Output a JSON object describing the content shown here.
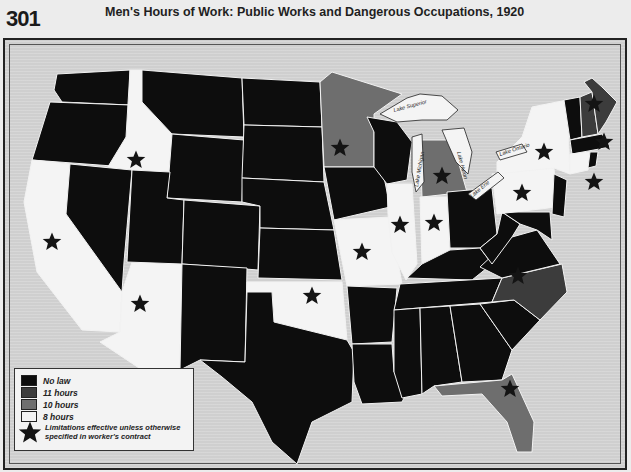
{
  "header": {
    "plate_number": "301",
    "title": "Men's Hours of Work: Public Works and Dangerous Occupations, 1920"
  },
  "colors": {
    "no_law": "#0d0d0d",
    "11_hours": "#3c3c3c",
    "10_hours": "#6e6e6e",
    "8_hours": "#f4f4f4",
    "background": "#cfcfcf",
    "star": "#141414"
  },
  "legend": {
    "items": [
      {
        "key": "no_law",
        "label": "No law",
        "color": "#0d0d0d"
      },
      {
        "key": "11_hours",
        "label": "11 hours",
        "color": "#3c3c3c"
      },
      {
        "key": "10_hours",
        "label": "10 hours",
        "color": "#6e6e6e"
      },
      {
        "key": "8_hours",
        "label": "8 hours",
        "color": "#f4f4f4"
      }
    ],
    "star_note": "Limitations effective unless otherwise specified in worker's contract"
  },
  "lakes": [
    {
      "name": "Lake Superior",
      "label": "Lake Superior"
    },
    {
      "name": "Lake Michigan",
      "label": "Lake Michigan"
    },
    {
      "name": "Lake Huron",
      "label": "Lake Huron"
    },
    {
      "name": "Lake Erie",
      "label": "Lake Erie"
    },
    {
      "name": "Lake Ontario",
      "label": "Lake Ontario"
    }
  ],
  "states": [
    {
      "name": "Washington",
      "category": "no_law",
      "star": false
    },
    {
      "name": "Oregon",
      "category": "no_law",
      "star": false
    },
    {
      "name": "California",
      "category": "8_hours",
      "star": true
    },
    {
      "name": "Idaho",
      "category": "8_hours",
      "star": true
    },
    {
      "name": "Nevada",
      "category": "no_law",
      "star": false
    },
    {
      "name": "Arizona",
      "category": "8_hours",
      "star": true
    },
    {
      "name": "Montana",
      "category": "no_law",
      "star": false
    },
    {
      "name": "Wyoming",
      "category": "no_law",
      "star": false
    },
    {
      "name": "Utah",
      "category": "no_law",
      "star": false
    },
    {
      "name": "Colorado",
      "category": "no_law",
      "star": false
    },
    {
      "name": "New Mexico",
      "category": "no_law",
      "star": false
    },
    {
      "name": "North Dakota",
      "category": "no_law",
      "star": false
    },
    {
      "name": "South Dakota",
      "category": "no_law",
      "star": false
    },
    {
      "name": "Nebraska",
      "category": "no_law",
      "star": false
    },
    {
      "name": "Kansas",
      "category": "no_law",
      "star": false
    },
    {
      "name": "Oklahoma",
      "category": "8_hours",
      "star": true
    },
    {
      "name": "Texas",
      "category": "no_law",
      "star": false
    },
    {
      "name": "Minnesota",
      "category": "10_hours",
      "star": true
    },
    {
      "name": "Iowa",
      "category": "no_law",
      "star": false
    },
    {
      "name": "Missouri",
      "category": "8_hours",
      "star": true
    },
    {
      "name": "Arkansas",
      "category": "no_law",
      "star": false
    },
    {
      "name": "Louisiana",
      "category": "no_law",
      "star": false
    },
    {
      "name": "Wisconsin",
      "category": "no_law",
      "star": false
    },
    {
      "name": "Illinois",
      "category": "8_hours",
      "star": true
    },
    {
      "name": "Michigan",
      "category": "10_hours",
      "star": true
    },
    {
      "name": "Indiana",
      "category": "8_hours",
      "star": true
    },
    {
      "name": "Ohio",
      "category": "no_law",
      "star": false
    },
    {
      "name": "Kentucky",
      "category": "no_law",
      "star": false
    },
    {
      "name": "Tennessee",
      "category": "no_law",
      "star": false
    },
    {
      "name": "Mississippi",
      "category": "no_law",
      "star": false
    },
    {
      "name": "Alabama",
      "category": "no_law",
      "star": false
    },
    {
      "name": "Georgia",
      "category": "no_law",
      "star": false
    },
    {
      "name": "Florida",
      "category": "10_hours",
      "star": true
    },
    {
      "name": "South Carolina",
      "category": "no_law",
      "star": false
    },
    {
      "name": "North Carolina",
      "category": "11_hours",
      "star": true
    },
    {
      "name": "Virginia",
      "category": "no_law",
      "star": false
    },
    {
      "name": "West Virginia",
      "category": "no_law",
      "star": false
    },
    {
      "name": "Maryland",
      "category": "no_law",
      "star": false
    },
    {
      "name": "Delaware",
      "category": "no_law",
      "star": false
    },
    {
      "name": "Pennsylvania",
      "category": "8_hours",
      "star": true
    },
    {
      "name": "New Jersey",
      "category": "no_law",
      "star": false
    },
    {
      "name": "New York",
      "category": "8_hours",
      "star": true
    },
    {
      "name": "Vermont",
      "category": "no_law",
      "star": false
    },
    {
      "name": "New Hampshire",
      "category": "11_hours",
      "star": true
    },
    {
      "name": "Maine",
      "category": "11_hours",
      "star": true
    },
    {
      "name": "Massachusetts",
      "category": "no_law",
      "star": false
    },
    {
      "name": "Connecticut",
      "category": "8_hours",
      "star": true
    },
    {
      "name": "Rhode Island",
      "category": "no_law",
      "star": false
    }
  ]
}
